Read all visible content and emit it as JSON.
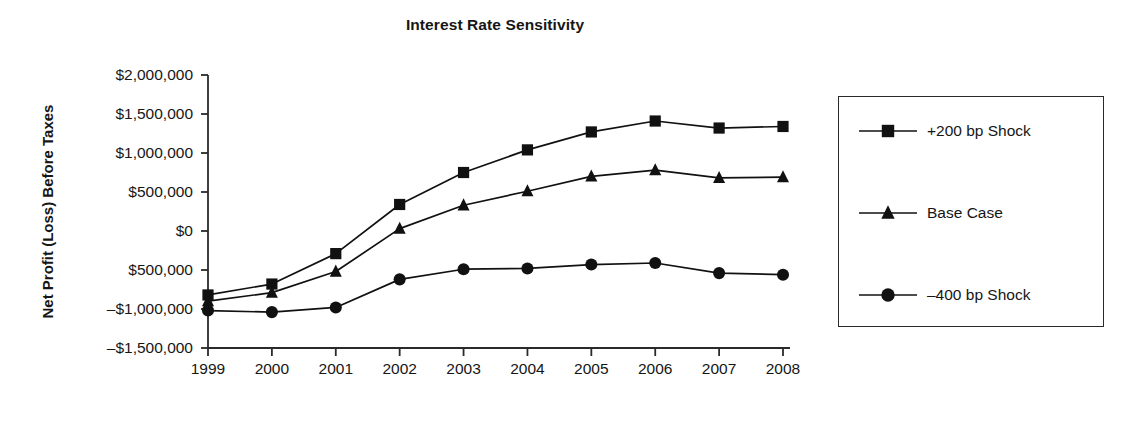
{
  "chart_data": {
    "type": "line",
    "title": "Interest Rate Sensitivity",
    "xlabel": "",
    "ylabel": "Net Profit (Loss) Before Taxes",
    "x": [
      "1999",
      "2000",
      "2001",
      "2002",
      "2003",
      "2004",
      "2005",
      "2006",
      "2007",
      "2008"
    ],
    "categories": [
      "1999",
      "2000",
      "2001",
      "2002",
      "2003",
      "2004",
      "2005",
      "2006",
      "2007",
      "2008"
    ],
    "ylim": [
      -1500000,
      2000000
    ],
    "ytick_values": [
      2000000,
      1500000,
      1000000,
      500000,
      0,
      -500000,
      -1000000,
      -1500000
    ],
    "ytick_labels": [
      "$2,000,000",
      "$1,500,000",
      "$1,000,000",
      "$500,000",
      "$0",
      "$500,000",
      "–$1,000,000",
      "–$1,500,000"
    ],
    "grid": false,
    "legend_position": "right",
    "series": [
      {
        "name": "+200 bp Shock",
        "marker": "square",
        "color": "#111111",
        "values": [
          -820000,
          -680000,
          -290000,
          340000,
          750000,
          1040000,
          1270000,
          1410000,
          1320000,
          1340000
        ]
      },
      {
        "name": "Base Case",
        "marker": "triangle",
        "color": "#111111",
        "values": [
          -900000,
          -790000,
          -520000,
          30000,
          330000,
          510000,
          700000,
          780000,
          680000,
          690000
        ]
      },
      {
        "name": "–400 bp Shock",
        "marker": "circle",
        "color": "#111111",
        "values": [
          -1020000,
          -1040000,
          -980000,
          -620000,
          -490000,
          -480000,
          -430000,
          -410000,
          -540000,
          -560000
        ]
      }
    ]
  },
  "legend": {
    "entries": [
      {
        "label": "+200 bp Shock",
        "marker": "square"
      },
      {
        "label": "Base Case",
        "marker": "triangle"
      },
      {
        "label": "–400 bp Shock",
        "marker": "circle"
      }
    ]
  },
  "axes": {
    "y_title": "Net Profit (Loss) Before Taxes",
    "y_labels": [
      "$2,000,000",
      "$1,500,000",
      "$1,000,000",
      "$500,000",
      "$0",
      "$500,000",
      "–$1,000,000",
      "–$1,500,000"
    ],
    "x_labels": [
      "1999",
      "2000",
      "2001",
      "2002",
      "2003",
      "2004",
      "2005",
      "2006",
      "2007",
      "2008"
    ]
  },
  "colors": {
    "ink": "#111111",
    "axis": "#2a2a2a",
    "background": "#ffffff"
  }
}
